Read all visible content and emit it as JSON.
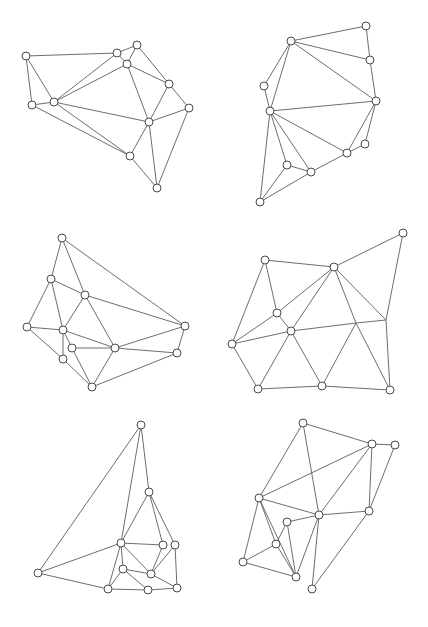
{
  "style": {
    "edge_color": "#6e6e6e",
    "node_stroke": "#4a4a4a",
    "node_fill": "#ffffff",
    "node_radius": 4
  },
  "graphs": [
    {
      "id": "graph-1",
      "nodes": {
        "A": [
          26,
          56
        ],
        "B": [
          117,
          53
        ],
        "C": [
          137,
          45
        ],
        "D": [
          127,
          64
        ],
        "E": [
          169,
          84
        ],
        "F": [
          189,
          108
        ],
        "G": [
          32,
          105
        ],
        "H": [
          54,
          102
        ],
        "I": [
          149,
          122
        ],
        "J": [
          130,
          156
        ],
        "K": [
          157,
          188
        ]
      },
      "edges": [
        [
          "A",
          "B"
        ],
        [
          "A",
          "G"
        ],
        [
          "A",
          "H"
        ],
        [
          "B",
          "C"
        ],
        [
          "B",
          "D"
        ],
        [
          "B",
          "H"
        ],
        [
          "C",
          "D"
        ],
        [
          "C",
          "E"
        ],
        [
          "D",
          "H"
        ],
        [
          "D",
          "E"
        ],
        [
          "D",
          "I"
        ],
        [
          "E",
          "I"
        ],
        [
          "E",
          "F"
        ],
        [
          "F",
          "I"
        ],
        [
          "F",
          "K"
        ],
        [
          "G",
          "H"
        ],
        [
          "G",
          "J"
        ],
        [
          "H",
          "I"
        ],
        [
          "H",
          "J"
        ],
        [
          "I",
          "J"
        ],
        [
          "I",
          "K"
        ],
        [
          "J",
          "K"
        ]
      ]
    },
    {
      "id": "graph-2",
      "nodes": {
        "A": [
          366,
          26
        ],
        "B": [
          291,
          41
        ],
        "C": [
          370,
          60
        ],
        "D": [
          264,
          86
        ],
        "E": [
          376,
          101
        ],
        "F": [
          270,
          111
        ],
        "G": [
          365,
          144
        ],
        "H": [
          347,
          153
        ],
        "I": [
          287,
          165
        ],
        "J": [
          311,
          172
        ],
        "K": [
          260,
          202
        ]
      },
      "edges": [
        [
          "A",
          "B"
        ],
        [
          "A",
          "C"
        ],
        [
          "B",
          "C"
        ],
        [
          "B",
          "D"
        ],
        [
          "B",
          "F"
        ],
        [
          "B",
          "E"
        ],
        [
          "C",
          "E"
        ],
        [
          "D",
          "F"
        ],
        [
          "F",
          "E"
        ],
        [
          "F",
          "H"
        ],
        [
          "F",
          "I"
        ],
        [
          "F",
          "J"
        ],
        [
          "F",
          "K"
        ],
        [
          "E",
          "G"
        ],
        [
          "E",
          "H"
        ],
        [
          "G",
          "H"
        ],
        [
          "H",
          "J"
        ],
        [
          "I",
          "J"
        ],
        [
          "I",
          "K"
        ],
        [
          "J",
          "K"
        ]
      ]
    },
    {
      "id": "graph-3",
      "nodes": {
        "A": [
          62,
          238
        ],
        "B": [
          51,
          279
        ],
        "C": [
          85,
          295
        ],
        "D": [
          27,
          327
        ],
        "E": [
          63,
          330
        ],
        "F": [
          72,
          348
        ],
        "G": [
          63,
          359
        ],
        "H": [
          115,
          348
        ],
        "I": [
          185,
          326
        ],
        "J": [
          177,
          353
        ],
        "K": [
          92,
          387
        ]
      },
      "edges": [
        [
          "A",
          "B"
        ],
        [
          "A",
          "C"
        ],
        [
          "A",
          "I"
        ],
        [
          "B",
          "C"
        ],
        [
          "B",
          "D"
        ],
        [
          "B",
          "E"
        ],
        [
          "C",
          "E"
        ],
        [
          "C",
          "H"
        ],
        [
          "C",
          "I"
        ],
        [
          "D",
          "E"
        ],
        [
          "D",
          "G"
        ],
        [
          "E",
          "H"
        ],
        [
          "E",
          "G"
        ],
        [
          "E",
          "F"
        ],
        [
          "F",
          "H"
        ],
        [
          "F",
          "K"
        ],
        [
          "G",
          "K"
        ],
        [
          "H",
          "I"
        ],
        [
          "H",
          "J"
        ],
        [
          "H",
          "K"
        ],
        [
          "I",
          "J"
        ],
        [
          "J",
          "K"
        ]
      ]
    },
    {
      "id": "graph-4",
      "nodes": {
        "A": [
          403,
          233
        ],
        "B": [
          265,
          260
        ],
        "C": [
          334,
          267
        ],
        "D": [
          277,
          313
        ],
        "E": [
          291,
          331
        ],
        "F": [
          232,
          344
        ],
        "G": [
          258,
          389
        ],
        "H": [
          322,
          386
        ],
        "I": [
          390,
          390
        ]
      },
      "junctions": {
        "J1": [
          356,
          323
        ],
        "J2": [
          386,
          320
        ]
      },
      "edges": [
        [
          "B",
          "C"
        ],
        [
          "C",
          "A"
        ],
        [
          "A",
          "J2"
        ],
        [
          "J2",
          "I"
        ],
        [
          "C",
          "J2"
        ],
        [
          "C",
          "D"
        ],
        [
          "C",
          "E"
        ],
        [
          "C",
          "J1"
        ],
        [
          "J1",
          "I"
        ],
        [
          "B",
          "D"
        ],
        [
          "B",
          "F"
        ],
        [
          "D",
          "F"
        ],
        [
          "D",
          "E"
        ],
        [
          "F",
          "E"
        ],
        [
          "E",
          "J1"
        ],
        [
          "J1",
          "J2"
        ],
        [
          "F",
          "G"
        ],
        [
          "E",
          "G"
        ],
        [
          "E",
          "H"
        ],
        [
          "J1",
          "H"
        ],
        [
          "G",
          "H"
        ],
        [
          "H",
          "I"
        ]
      ]
    },
    {
      "id": "graph-5",
      "nodes": {
        "A": [
          141,
          425
        ],
        "B": [
          149,
          492
        ],
        "C": [
          121,
          543
        ],
        "D": [
          163,
          545
        ],
        "E": [
          175,
          545
        ],
        "F": [
          38,
          573
        ],
        "G": [
          123,
          569
        ],
        "H": [
          151,
          574
        ],
        "I": [
          108,
          589
        ],
        "J": [
          148,
          590
        ],
        "K": [
          177,
          588
        ]
      },
      "edges": [
        [
          "A",
          "F"
        ],
        [
          "A",
          "C"
        ],
        [
          "A",
          "B"
        ],
        [
          "B",
          "C"
        ],
        [
          "B",
          "D"
        ],
        [
          "B",
          "E"
        ],
        [
          "C",
          "D"
        ],
        [
          "C",
          "F"
        ],
        [
          "C",
          "G"
        ],
        [
          "C",
          "I"
        ],
        [
          "C",
          "H"
        ],
        [
          "D",
          "H"
        ],
        [
          "E",
          "H"
        ],
        [
          "E",
          "K"
        ],
        [
          "F",
          "I"
        ],
        [
          "G",
          "I"
        ],
        [
          "G",
          "H"
        ],
        [
          "G",
          "J"
        ],
        [
          "H",
          "K"
        ],
        [
          "I",
          "J"
        ],
        [
          "J",
          "K"
        ]
      ]
    },
    {
      "id": "graph-6",
      "nodes": {
        "A": [
          303,
          423
        ],
        "B": [
          372,
          444
        ],
        "C": [
          395,
          445
        ],
        "D": [
          259,
          498
        ],
        "E": [
          319,
          515
        ],
        "F": [
          369,
          511
        ],
        "G": [
          287,
          522
        ],
        "H": [
          276,
          544
        ],
        "I": [
          243,
          562
        ],
        "J": [
          296,
          577
        ],
        "K": [
          312,
          589
        ]
      },
      "edges": [
        [
          "A",
          "B"
        ],
        [
          "A",
          "D"
        ],
        [
          "A",
          "E"
        ],
        [
          "B",
          "C"
        ],
        [
          "B",
          "D"
        ],
        [
          "B",
          "E"
        ],
        [
          "B",
          "F"
        ],
        [
          "C",
          "F"
        ],
        [
          "D",
          "E"
        ],
        [
          "D",
          "H"
        ],
        [
          "D",
          "J"
        ],
        [
          "D",
          "I"
        ],
        [
          "E",
          "F"
        ],
        [
          "E",
          "G"
        ],
        [
          "E",
          "J"
        ],
        [
          "E",
          "K"
        ],
        [
          "F",
          "K"
        ],
        [
          "G",
          "H"
        ],
        [
          "G",
          "J"
        ],
        [
          "H",
          "I"
        ],
        [
          "H",
          "J"
        ],
        [
          "I",
          "J"
        ]
      ]
    }
  ]
}
